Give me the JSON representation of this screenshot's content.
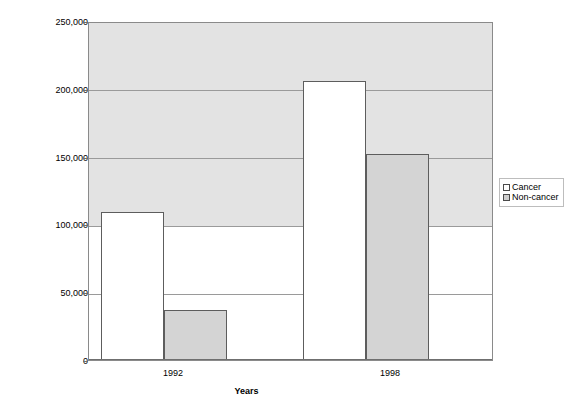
{
  "chart_data": {
    "type": "bar",
    "title": "",
    "xlabel": "Years",
    "ylabel": "",
    "categories": [
      "1992",
      "1998"
    ],
    "series": [
      {
        "name": "Cancer",
        "color": "#ffffff",
        "values": [
          110000,
          207000
        ]
      },
      {
        "name": "Non-cancer",
        "color": "#d4d4d4",
        "values": [
          37000,
          153000
        ]
      }
    ],
    "ylim": [
      0,
      250000
    ],
    "ytick_values": [
      0,
      50000,
      100000,
      150000,
      200000,
      250000
    ],
    "ytick_labels": [
      "0",
      "50,000",
      "100,000",
      "150,000",
      "200,000",
      "250,000"
    ],
    "grid": true,
    "legend_position": "right"
  },
  "axes": {
    "x_title": "Years",
    "x_tick_labels": [
      "1992",
      "1998"
    ],
    "y_tick_labels": [
      "250,000",
      "200,000",
      "150,000",
      "100,000",
      "50,000",
      "0"
    ]
  },
  "legend": {
    "items": [
      {
        "label": "Cancer",
        "swatch": "white-square-swatch"
      },
      {
        "label": "Non-cancer",
        "swatch": "gray-square-swatch"
      }
    ]
  },
  "colors": {
    "cancer_fill": "#ffffff",
    "noncancer_fill": "#d4d4d4",
    "plot_upper_band": "#e3e3e3",
    "plot_lower_band": "#ffffff",
    "gridline": "#9a9a9a",
    "bar_border": "#5d5d5d"
  }
}
